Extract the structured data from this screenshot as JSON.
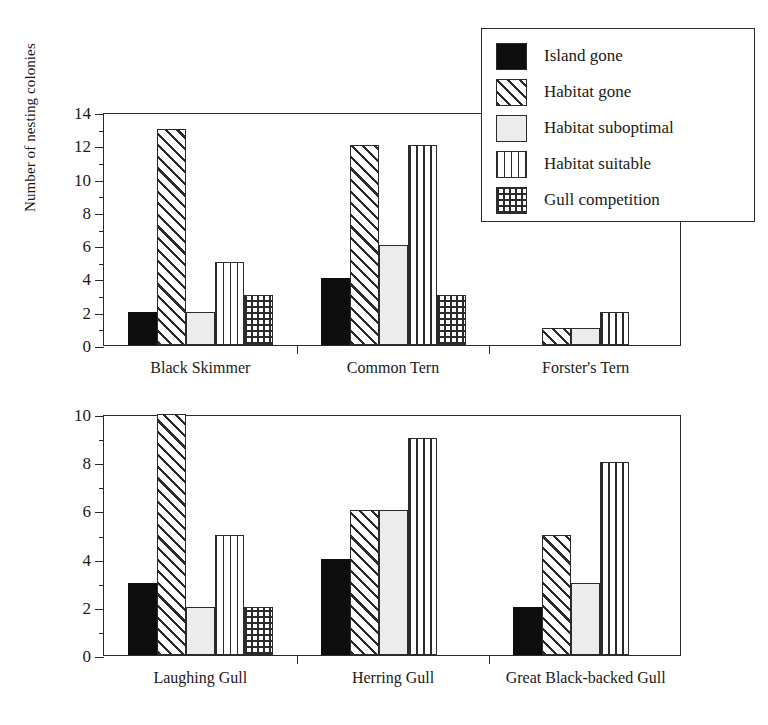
{
  "chart_data": {
    "type": "bar",
    "title": "",
    "xlabel": "",
    "ylabel": "Number of nesting colonies",
    "grid": false,
    "legend_position": "top-right",
    "legend_entries": [
      "Island gone",
      "Habitat gone",
      "Habitat suboptimal",
      "Habitat suitable",
      "Gull competition"
    ],
    "panels": [
      {
        "name": "top",
        "categories": [
          "Black Skimmer",
          "Common Tern",
          "Forster's Tern"
        ],
        "ylim": [
          0,
          14
        ],
        "ytick_labels": [
          "0",
          "2",
          "4",
          "6",
          "8",
          "10",
          "12",
          "14"
        ],
        "ytick_values": [
          0,
          2,
          4,
          6,
          8,
          10,
          12,
          14
        ],
        "minor_tick_step": 1,
        "series": [
          {
            "name": "Island gone",
            "values": [
              2,
              4,
              0
            ]
          },
          {
            "name": "Habitat gone",
            "values": [
              13,
              12,
              1
            ]
          },
          {
            "name": "Habitat suboptimal",
            "values": [
              2,
              6,
              1
            ]
          },
          {
            "name": "Habitat suitable",
            "values": [
              5,
              12,
              2
            ]
          },
          {
            "name": "Gull competition",
            "values": [
              3,
              3,
              0
            ]
          }
        ]
      },
      {
        "name": "bottom",
        "categories": [
          "Laughing Gull",
          "Herring Gull",
          "Great Black-backed Gull"
        ],
        "ylim": [
          0,
          10
        ],
        "ytick_labels": [
          "0",
          "2",
          "4",
          "6",
          "8",
          "10"
        ],
        "ytick_values": [
          0,
          2,
          4,
          6,
          8,
          10
        ],
        "minor_tick_step": 1,
        "series": [
          {
            "name": "Island gone",
            "values": [
              3,
              4,
              2
            ]
          },
          {
            "name": "Habitat gone",
            "values": [
              10,
              6,
              5
            ]
          },
          {
            "name": "Habitat suboptimal",
            "values": [
              2,
              6,
              3
            ]
          },
          {
            "name": "Habitat suitable",
            "values": [
              5,
              9,
              8
            ]
          },
          {
            "name": "Gull competition",
            "values": [
              2,
              0,
              0
            ]
          }
        ]
      }
    ],
    "patterns": {
      "Island gone": "solid-black",
      "Habitat gone": "diagonal-hatch",
      "Habitat suboptimal": "blank-white",
      "Habitat suitable": "vertical-lines",
      "Gull competition": "cross-hatch"
    }
  },
  "colors": {
    "axis": "#2b2b2b",
    "solid_fill": "#0d0d0d",
    "blank_fill": "#ececec",
    "background": "#ffffff"
  }
}
